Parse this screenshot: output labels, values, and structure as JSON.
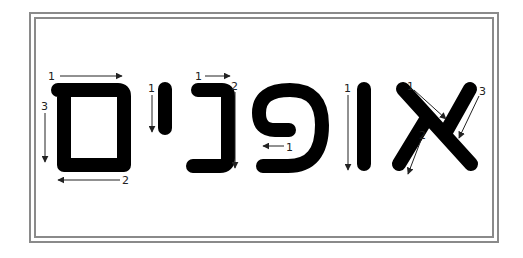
{
  "word": "אופנים",
  "letters": [
    {
      "name": "final-mem",
      "char": "ם",
      "strokes": [
        {
          "order": "1",
          "direction": "right"
        },
        {
          "order": "2",
          "direction": "left"
        },
        {
          "order": "3",
          "direction": "down"
        }
      ]
    },
    {
      "name": "yod",
      "char": "י",
      "strokes": [
        {
          "order": "1",
          "direction": "down"
        }
      ]
    },
    {
      "name": "nun",
      "char": "נ",
      "strokes": [
        {
          "order": "1",
          "direction": "right"
        },
        {
          "order": "2",
          "direction": "down"
        }
      ]
    },
    {
      "name": "pe",
      "char": "פ",
      "strokes": [
        {
          "order": "1",
          "direction": "left"
        },
        {
          "order": "2",
          "direction": "down"
        }
      ]
    },
    {
      "name": "vav",
      "char": "ו",
      "strokes": [
        {
          "order": "1",
          "direction": "down"
        }
      ]
    },
    {
      "name": "alef",
      "char": "א",
      "strokes": [
        {
          "order": "1",
          "direction": "down-right"
        },
        {
          "order": "2",
          "direction": "down-left"
        },
        {
          "order": "3",
          "direction": "down-left"
        }
      ]
    }
  ],
  "colors": {
    "ink": "#000000",
    "frame": "#8a8a8a",
    "arrow": "#222222"
  }
}
